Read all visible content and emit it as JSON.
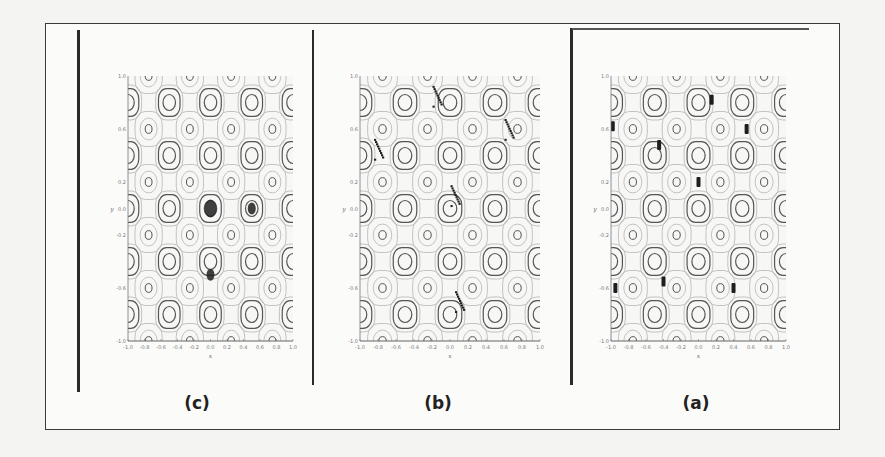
{
  "figure": {
    "panels": [
      {
        "id": "c",
        "label": "(c)",
        "xlabel": "x",
        "ylabel": "y",
        "markers": [
          {
            "x": 0.0,
            "y": 0.0,
            "shape": "cluster-large"
          },
          {
            "x": 0.5,
            "y": 0.0,
            "shape": "cluster-small"
          },
          {
            "x": 0.0,
            "y": -0.5,
            "shape": "cluster-small"
          }
        ]
      },
      {
        "id": "b",
        "label": "(b)",
        "xlabel": "x",
        "ylabel": "y",
        "markers": [
          {
            "x": -0.15,
            "y": 0.85,
            "shape": "dots"
          },
          {
            "x": 0.65,
            "y": 0.6,
            "shape": "dots"
          },
          {
            "x": -0.8,
            "y": 0.45,
            "shape": "dots"
          },
          {
            "x": 0.05,
            "y": 0.1,
            "shape": "dots"
          },
          {
            "x": 0.1,
            "y": -0.7,
            "shape": "dots"
          }
        ]
      },
      {
        "id": "a",
        "label": "(a)",
        "xlabel": "x",
        "ylabel": "y",
        "markers": [
          {
            "x": 0.15,
            "y": 0.82,
            "shape": "bar"
          },
          {
            "x": -0.98,
            "y": 0.62,
            "shape": "bar"
          },
          {
            "x": 0.55,
            "y": 0.6,
            "shape": "bar"
          },
          {
            "x": -0.45,
            "y": 0.48,
            "shape": "bar"
          },
          {
            "x": 0.0,
            "y": 0.2,
            "shape": "bar"
          },
          {
            "x": -0.95,
            "y": -0.6,
            "shape": "bar"
          },
          {
            "x": -0.4,
            "y": -0.55,
            "shape": "bar"
          },
          {
            "x": 0.4,
            "y": -0.6,
            "shape": "bar"
          }
        ]
      }
    ],
    "x_ticks": [
      "-1.0",
      "-0.8",
      "-0.6",
      "-0.4",
      "-0.2",
      "0.0",
      "0.2",
      "0.4",
      "0.6",
      "0.8",
      "1.0"
    ],
    "y_ticks": [
      "1.0",
      "0.8",
      "0.6",
      "0.4",
      "0.2",
      "0.0",
      "-0.2",
      "-0.4",
      "-0.6",
      "-0.8",
      "-1.0"
    ],
    "colors": {
      "contour_dark": "#555555",
      "contour_light": "#b5b5b5",
      "marker": "#1e1e1e",
      "frame": "#2a2a2a"
    }
  }
}
